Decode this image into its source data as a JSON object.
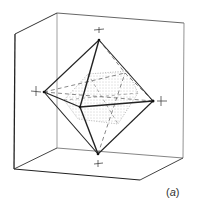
{
  "figure": {
    "label_open": "(",
    "label_letter": "a",
    "label_close": ")",
    "colors": {
      "background": "#ffffff",
      "solid_edge": "#222222",
      "cube_edge": "#555555",
      "hidden_edge": "#666666",
      "dotted_fill": "#999999"
    }
  }
}
